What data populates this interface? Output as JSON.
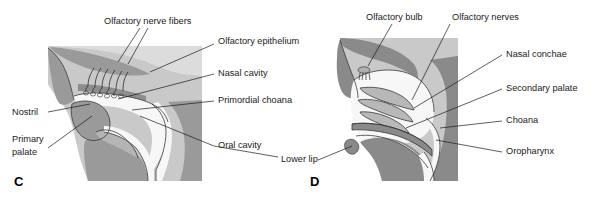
{
  "figure": {
    "panels": [
      {
        "letter": "C",
        "letter_pos": {
          "x": 14,
          "y": 186
        },
        "labels": [
          {
            "id": "olfactory-nerve-fibers",
            "text": "Olfactory nerve fibers",
            "x": 104,
            "y": 22,
            "anchor": "start"
          },
          {
            "id": "olfactory-epithelium",
            "text": "Olfactory epithelium",
            "x": 218,
            "y": 42,
            "anchor": "start"
          },
          {
            "id": "nasal-cavity",
            "text": "Nasal cavity",
            "x": 218,
            "y": 74,
            "anchor": "start"
          },
          {
            "id": "primordial-choana",
            "text": "Primordial choana",
            "x": 218,
            "y": 101,
            "anchor": "start"
          },
          {
            "id": "oral-cavity",
            "text": "Oral cavity",
            "x": 218,
            "y": 146,
            "anchor": "start"
          },
          {
            "id": "nostril",
            "text": "Nostril",
            "x": 12,
            "y": 113,
            "anchor": "start"
          },
          {
            "id": "primary-palate-line1",
            "text": "Primary",
            "x": 12,
            "y": 140,
            "anchor": "start"
          },
          {
            "id": "primary-palate-line2",
            "text": "palate",
            "x": 12,
            "y": 153,
            "anchor": "start"
          }
        ]
      },
      {
        "letter": "D",
        "letter_pos": {
          "x": 310,
          "y": 186
        },
        "labels": [
          {
            "id": "olfactory-bulb",
            "text": "Olfactory bulb",
            "x": 366,
            "y": 18,
            "anchor": "start"
          },
          {
            "id": "olfactory-nerves",
            "text": "Olfactory nerves",
            "x": 452,
            "y": 18,
            "anchor": "start"
          },
          {
            "id": "nasal-conchae",
            "text": "Nasal conchae",
            "x": 506,
            "y": 55,
            "anchor": "start"
          },
          {
            "id": "secondary-palate",
            "text": "Secondary palate",
            "x": 506,
            "y": 89,
            "anchor": "start"
          },
          {
            "id": "choana",
            "text": "Choana",
            "x": 506,
            "y": 121,
            "anchor": "start"
          },
          {
            "id": "oropharynx",
            "text": "Oropharynx",
            "x": 506,
            "y": 152,
            "anchor": "start"
          },
          {
            "id": "lower-lip",
            "text": "Lower lip",
            "x": 281,
            "y": 160,
            "anchor": "start"
          }
        ]
      }
    ],
    "colors": {
      "background": "#ffffff",
      "block_gray": "#a8a8a8",
      "tissue_mid": "#9a9a9a",
      "tissue_light": "#c9c9c9",
      "tissue_pale": "#dcdcdc",
      "cavity_white": "#f7f7f7",
      "outline": "#3a3a3a",
      "text": "#1a1a1a"
    }
  }
}
